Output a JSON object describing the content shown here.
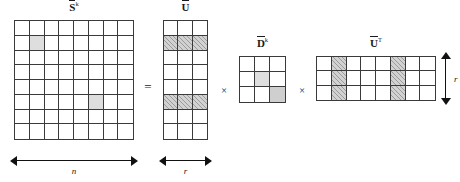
{
  "figure": {
    "type": "matrix-factorization-diagram",
    "equation": "S^k = U x D^k x U^T",
    "background_color": "#ffffff",
    "line_color": "#3a3a3a",
    "shade_color": "#dedede",
    "hatch_color": "#d2d2d2"
  },
  "matrices": {
    "s": {
      "label_base": "S",
      "label_sup": "k",
      "rows": 8,
      "cols": 8,
      "shaded_cells": [
        [
          2,
          2
        ],
        [
          6,
          6
        ]
      ],
      "dim_label": "n"
    },
    "u": {
      "label_base": "U",
      "label_sup": "",
      "rows": 8,
      "cols": 3,
      "hatched_rows": [
        2,
        6
      ],
      "dim_label": "r"
    },
    "d": {
      "label_base": "D",
      "label_sup": "k",
      "rows": 3,
      "cols": 3,
      "shaded_light_cells": [
        [
          2,
          2
        ]
      ],
      "shaded_mid_cells": [
        [
          3,
          3
        ]
      ]
    },
    "ut": {
      "label_base": "U",
      "label_sup": "T",
      "rows": 3,
      "cols": 8,
      "hatched_cols": [
        2,
        6
      ],
      "dim_label": "r"
    }
  },
  "operators": {
    "equals": "=",
    "times_1": "×",
    "times_2": "×"
  }
}
